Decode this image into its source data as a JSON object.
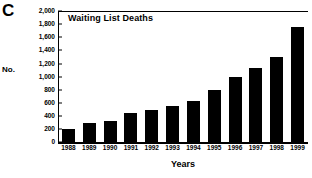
{
  "panel": {
    "letter": "C"
  },
  "axes": {
    "y_caption": "No.",
    "x_title": "Years"
  },
  "chart_data": {
    "type": "bar",
    "title": "Waiting List Deaths",
    "xlabel": "Years",
    "ylabel": "No.",
    "ylim": [
      0,
      2000
    ],
    "yticks": [
      0,
      200,
      400,
      600,
      800,
      1000,
      1200,
      1400,
      1600,
      1800,
      2000
    ],
    "ytick_labels": [
      "0",
      "200",
      "400",
      "600",
      "800",
      "1,000",
      "1,200",
      "1,400",
      "1,600",
      "1,800",
      "2,000"
    ],
    "grid": false,
    "legend": false,
    "bar_color": "#000000",
    "categories": [
      "1988",
      "1989",
      "1990",
      "1991",
      "1992",
      "1993",
      "1994",
      "1995",
      "1996",
      "1997",
      "1998",
      "1999"
    ],
    "values": [
      200,
      300,
      325,
      450,
      500,
      550,
      625,
      800,
      1000,
      1125,
      1300,
      1750
    ]
  }
}
